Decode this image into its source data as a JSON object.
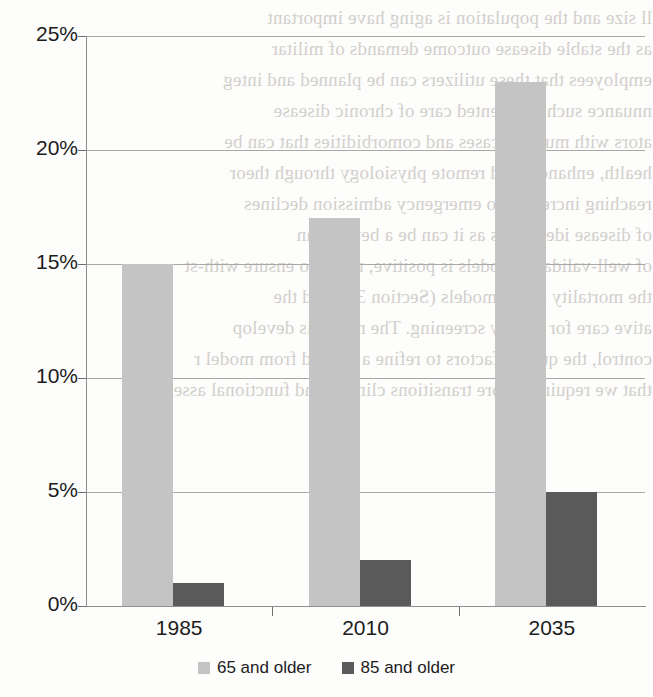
{
  "chart_data": {
    "type": "bar",
    "title": "",
    "subtitle": "",
    "xlabel": "",
    "ylabel": "",
    "categories": [
      "1985",
      "2010",
      "2035"
    ],
    "series": [
      {
        "name": "65 and older",
        "color": "#c4c4c4",
        "values": [
          15,
          17,
          23
        ]
      },
      {
        "name": "85 and older",
        "color": "#5a5a5a",
        "values": [
          1,
          2,
          5
        ]
      }
    ],
    "ylim": [
      0,
      25
    ],
    "ytick_values": [
      0,
      5,
      10,
      15,
      20,
      25
    ],
    "ytick_labels": [
      "0%",
      "5%",
      "10%",
      "15%",
      "20%",
      "25%"
    ],
    "value_suffix": "%",
    "grid": true,
    "grid_axis": "y",
    "legend_position": "bottom",
    "bar_group_mode": "grouped",
    "annotations": []
  },
  "legend": {
    "entries": [
      {
        "label": "65 and older",
        "color": "#c4c4c4"
      },
      {
        "label": "85 and older",
        "color": "#5a5a5a"
      }
    ]
  },
  "background_bleed": {
    "description": "faint mirrored show-through text from the reverse side of the scanned page",
    "lines": [
      "ll size and the population is aging have important",
      "as the stable disease outcome demands of militar",
      "employees that these utilizers can be planned and integ",
      "nnuance such as oriented care of chronic disease",
      "ators with multiple cases and comorbidities that can be",
      "health, enhances and remote physiology through theor",
      "reaching increased to emergency admission declines",
      "of disease identifiers as it can be a better than",
      "of well-validated models is positive, needs to ensure with-st",
      "the mortality of the models (Section 3.1) and the",
      "ative care for quality screening. The model is develop",
      "control, the quality factors to refine a unified from model r",
      "that we require a more transitions clinical and functional assess"
    ]
  }
}
